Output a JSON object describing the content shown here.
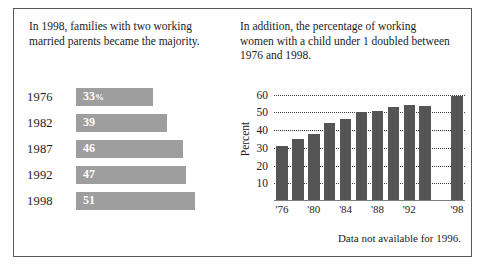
{
  "left": {
    "heading": "In 1998, families with two working married parents became the majority.",
    "chart_data": {
      "type": "bar",
      "orientation": "horizontal",
      "title": "In 1998, families with two working married parents became the majority.",
      "xlabel": "",
      "ylabel": "",
      "categories": [
        "1976",
        "1982",
        "1987",
        "1992",
        "1998"
      ],
      "values": [
        33,
        39,
        46,
        47,
        51
      ],
      "value_labels": [
        "33%",
        "39",
        "46",
        "47",
        "51"
      ],
      "unit": "percent",
      "xlim": [
        0,
        60
      ],
      "grid": false,
      "legend": false,
      "bar_color": "#9e9e9e",
      "label_color": "#ffffff"
    }
  },
  "right": {
    "heading": "In addition, the percentage of working women with a child under 1 doubled between 1976 and 1998.",
    "footnote": "Data not available for 1996.",
    "chart_data": {
      "type": "bar",
      "orientation": "vertical",
      "title": "In addition, the percentage of working women with a child under 1 doubled between 1976 and 1998.",
      "xlabel": "",
      "ylabel": "Percent",
      "x": [
        "'76",
        "'78",
        "'80",
        "'82",
        "'84",
        "'86",
        "'88",
        "'90",
        "'92",
        "'94",
        "'96",
        "'98"
      ],
      "values": [
        31,
        35,
        37.5,
        44,
        46.5,
        50,
        51,
        53,
        54,
        53.5,
        null,
        59
      ],
      "tick_labels": [
        "'76",
        "'80",
        "'84",
        "'88",
        "'92",
        "'98"
      ],
      "tick_positions": [
        0,
        2,
        4,
        6,
        8,
        11
      ],
      "yticks": [
        10,
        20,
        30,
        40,
        50,
        60
      ],
      "ylim": [
        0,
        62
      ],
      "grid": true,
      "grid_style": "dotted-horizontal",
      "legend": false,
      "bar_color": "#555555",
      "missing_note": "Data not available for 1996.",
      "unit": "percent"
    }
  },
  "style": {
    "background": "#ffffff",
    "border_color": "#5a5a5a",
    "text_color": "#1c1c1c"
  }
}
